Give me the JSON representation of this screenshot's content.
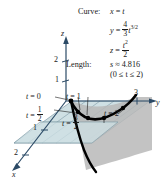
{
  "figure": {
    "title_terms": {
      "curve_label": "Curve:",
      "length_label": "Length:"
    },
    "equations": {
      "x_lhs": "x",
      "x_eq": "=",
      "x_rhs": "t",
      "y_lhs": "y",
      "y_eq": "=",
      "y_coef_num": "4",
      "y_coef_den": "3",
      "y_var": "t",
      "y_exp": "3/2",
      "z_lhs": "z",
      "z_eq": "=",
      "z_num": "t",
      "z_num_exp": "2",
      "z_den": "2"
    },
    "length": {
      "symbol": "s",
      "approx": "≈",
      "value": "4.816",
      "domain": "(0 ≤ t ≤ 2)"
    },
    "axes": {
      "z_label": "z",
      "y_label": "y",
      "x_label": "x",
      "z_ticks": [
        "1",
        "2"
      ],
      "y_ticks": [
        "3"
      ],
      "x_ticks": [
        "1",
        "2"
      ]
    },
    "curve_markers": [
      {
        "id": "t0",
        "text_lhs": "t",
        "text_eq": "=",
        "text_rhs": "0"
      },
      {
        "id": "thalf",
        "text_lhs": "t",
        "text_eq": "=",
        "num": "1",
        "den": "2"
      },
      {
        "id": "t1",
        "text_lhs": "t",
        "text_eq": "=",
        "text_rhs": "1"
      },
      {
        "id": "t32",
        "text_lhs": "t",
        "text_eq": "=",
        "num": "3",
        "den": "2"
      },
      {
        "id": "t2",
        "text_lhs": "t",
        "text_eq": "=",
        "text_rhs": "2"
      }
    ],
    "colors": {
      "plane_fill": "#cfe0e4",
      "plane_stroke": "#7e9aa6",
      "curtain_fill": "#b9b9b9",
      "curve_stroke": "#000000",
      "axis_stroke": "#2b4a66",
      "text": "#1a1a1a"
    }
  }
}
